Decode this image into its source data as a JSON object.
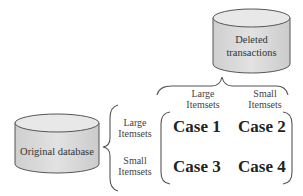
{
  "diagram": {
    "deleted_db": {
      "label_line1": "Deleted",
      "label_line2": "transactions"
    },
    "original_db": {
      "label": "Original database"
    },
    "column_headers": [
      {
        "line1": "Large",
        "line2": "Itemsets"
      },
      {
        "line1": "Small",
        "line2": "Itemsets"
      }
    ],
    "row_headers": [
      {
        "line1": "Large",
        "line2": "Itemsets"
      },
      {
        "line1": "Small",
        "line2": "Itemsets"
      }
    ],
    "cases": [
      {
        "label": "Case 1"
      },
      {
        "label": "Case 2"
      },
      {
        "label": "Case 3"
      },
      {
        "label": "Case 4"
      }
    ],
    "colors": {
      "cylinder_fill": "#d9d9d9",
      "cylinder_top": "#e8e8e8",
      "stroke": "#555555"
    }
  }
}
